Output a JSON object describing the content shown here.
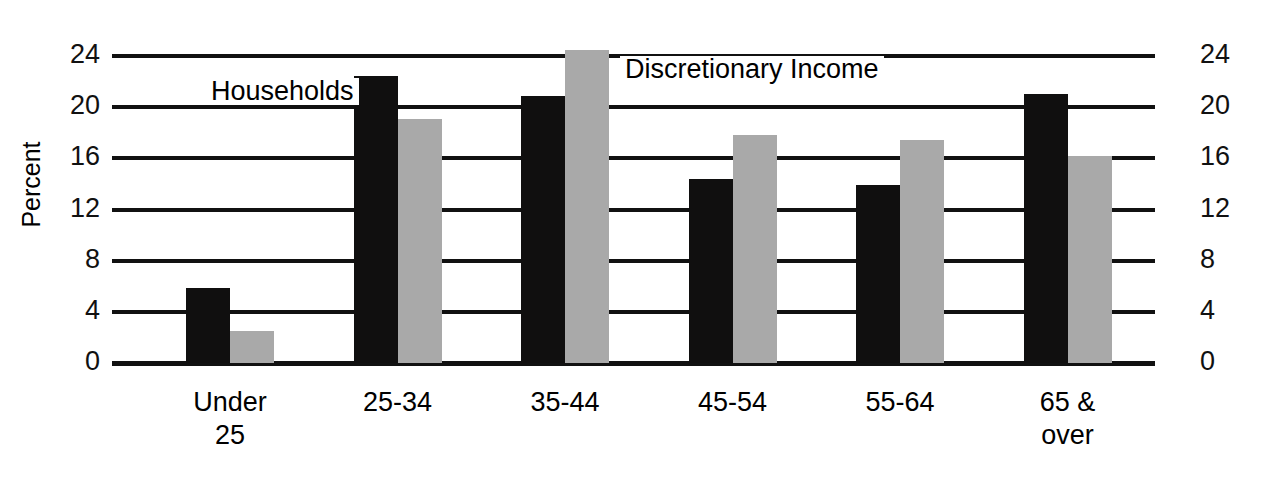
{
  "chart_data": {
    "type": "bar",
    "title": "",
    "xlabel": "",
    "ylabel": "Percent",
    "ylim": [
      0,
      24
    ],
    "yticks": [
      0,
      4,
      8,
      12,
      16,
      20,
      24
    ],
    "ytick_labels": [
      "0",
      "4",
      "8",
      "12",
      "16",
      "20",
      "24"
    ],
    "right_axis_labels": [
      "0",
      "4",
      "8",
      "12",
      "16",
      "20",
      "24"
    ],
    "grid": true,
    "legend_position": "inline-annotation",
    "categories": [
      "Under\n25",
      "25-34",
      "35-44",
      "45-54",
      "55-64",
      "65 &\nover"
    ],
    "series": [
      {
        "name": "Households",
        "color": "#100f0f",
        "values": [
          5.9,
          22.4,
          20.9,
          14.4,
          13.9,
          21.0
        ]
      },
      {
        "name": "Discretionary Income",
        "color": "#a9a9a9",
        "values": [
          2.5,
          19.1,
          24.5,
          17.8,
          17.4,
          16.2
        ]
      }
    ],
    "annotations": [
      {
        "text": "Households",
        "series": "Households"
      },
      {
        "text": "Discretionary Income",
        "series": "Discretionary Income"
      }
    ]
  },
  "axes": {
    "left_title": "Percent"
  },
  "colors": {
    "households": "#100f0f",
    "discretionary_income": "#a9a9a9",
    "axis": "#111111",
    "background": "#ffffff"
  }
}
